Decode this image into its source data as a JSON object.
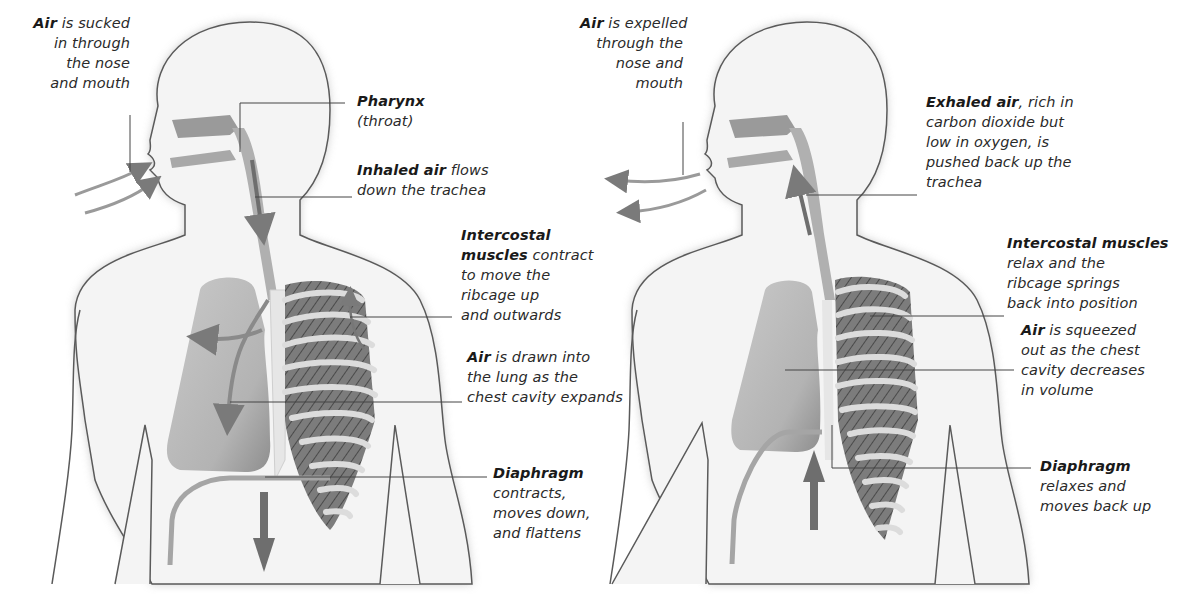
{
  "diagram": {
    "type": "anatomical-illustration",
    "colors": {
      "outline": "#5a5a5a",
      "body_fill": "#f2f2f2",
      "body_shadow": "#bdbdbd",
      "organ": "#b8b8b8",
      "muscle": "#6c6c6c",
      "rib": "#d9d9d9",
      "arrow": "#7a7a7a",
      "leader_line": "#444444",
      "text": "#2a2a2a"
    }
  },
  "panels": [
    {
      "id": "inhalation",
      "labels": [
        {
          "id": "air-in",
          "bold": "Air",
          "lines": [
            " is sucked",
            "in through",
            "the nose",
            "and mouth"
          ]
        },
        {
          "id": "pharynx",
          "bold": "Pharynx",
          "lines": [
            "",
            "(throat)"
          ]
        },
        {
          "id": "inhaled-air",
          "bold": "Inhaled air",
          "lines": [
            " flows",
            "down the trachea"
          ]
        },
        {
          "id": "intercostal-contract",
          "bold": "Intercostal",
          "bold2": "muscles",
          "lines": [
            "",
            " contract",
            "to move the",
            "ribcage up",
            "and outwards"
          ]
        },
        {
          "id": "air-drawn",
          "bold": "Air",
          "lines": [
            " is drawn into",
            "the lung as the",
            "chest cavity expands"
          ]
        },
        {
          "id": "diaphragm-contracts",
          "bold": "Diaphragm",
          "lines": [
            "",
            "contracts,",
            "moves down,",
            "and flattens"
          ]
        }
      ]
    },
    {
      "id": "exhalation",
      "labels": [
        {
          "id": "air-out",
          "bold": "Air",
          "lines": [
            " is expelled",
            "through the",
            "nose and",
            "mouth"
          ]
        },
        {
          "id": "exhaled-air",
          "bold": "Exhaled air",
          "lines": [
            ", rich in",
            "carbon dioxide but",
            "low in oxygen, is",
            "pushed back up the",
            "trachea"
          ]
        },
        {
          "id": "intercostal-relax",
          "bold": "Intercostal muscles",
          "lines": [
            "",
            "relax and the",
            "ribcage springs",
            "back into position"
          ]
        },
        {
          "id": "air-squeezed",
          "bold": "Air",
          "lines": [
            " is squeezed",
            "out as the chest",
            "cavity decreases",
            "in volume"
          ]
        },
        {
          "id": "diaphragm-relaxes",
          "bold": "Diaphragm",
          "lines": [
            "",
            "relaxes and",
            "moves back up"
          ]
        }
      ]
    }
  ]
}
